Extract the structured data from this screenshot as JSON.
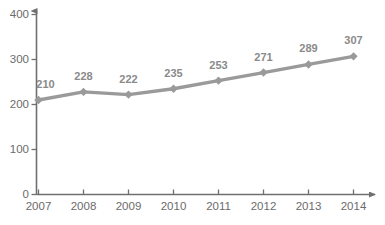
{
  "chart_data": {
    "type": "line",
    "title": "",
    "subtitle": "",
    "xlabel": "",
    "ylabel": "",
    "categories": [
      "2007",
      "2008",
      "2009",
      "2010",
      "2011",
      "2012",
      "2013",
      "2014"
    ],
    "values": [
      210,
      228,
      222,
      235,
      253,
      271,
      289,
      307
    ],
    "point_labels": [
      "210",
      "228",
      "222",
      "235",
      "253",
      "271",
      "289",
      "307"
    ],
    "series": [
      {
        "name": "",
        "values": [
          210,
          228,
          222,
          235,
          253,
          271,
          289,
          307
        ]
      }
    ],
    "ylim": [
      0,
      400
    ],
    "y_ticks": [
      0,
      100,
      200,
      300,
      400
    ],
    "y_tick_labels": [
      "0",
      "100",
      "200",
      "300",
      "400"
    ],
    "x_tick_labels": [
      "2007",
      "2008",
      "2009",
      "2010",
      "2011",
      "2012",
      "2013",
      "2014"
    ],
    "grid": false,
    "legend": false,
    "legend_position": "none",
    "annotations": [],
    "marker": "diamond",
    "colors": {
      "line": "#9a9a9a",
      "marker": "#9a9a9a",
      "axis": "#6f6f6f",
      "tick_text": "#6b6b6b",
      "data_label": "#8a8a8a",
      "background": "#ffffff"
    }
  }
}
